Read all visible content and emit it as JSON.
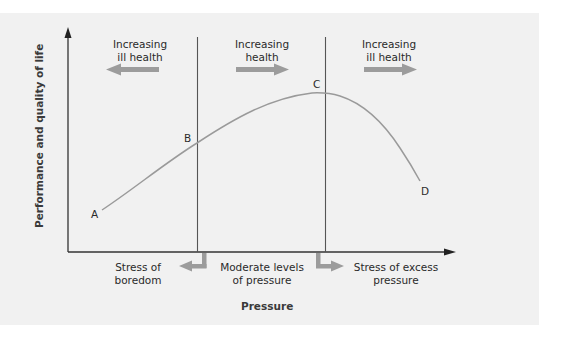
{
  "diagram": {
    "title": "",
    "y_axis_label": "Performance and quality of life",
    "x_axis_label": "Pressure",
    "zones_top": [
      {
        "line1": "Increasing",
        "line2": "ill health",
        "arrow_direction": "left"
      },
      {
        "line1": "Increasing",
        "line2": "health",
        "arrow_direction": "right"
      },
      {
        "line1": "Increasing",
        "line2": "ill health",
        "arrow_direction": "right"
      }
    ],
    "zones_bottom": [
      {
        "line1": "Stress of",
        "line2": "boredom"
      },
      {
        "line1": "Moderate levels",
        "line2": "of pressure"
      },
      {
        "line1": "Stress of excess",
        "line2": "pressure"
      }
    ],
    "points": [
      {
        "label": "A"
      },
      {
        "label": "B"
      },
      {
        "label": "C"
      },
      {
        "label": "D"
      }
    ],
    "colors": {
      "panel_background": "#f1f1f1",
      "axis": "#333333",
      "curve": "#9a9a9a",
      "divider": "#555555",
      "arrow": "#9c9c9c"
    }
  }
}
